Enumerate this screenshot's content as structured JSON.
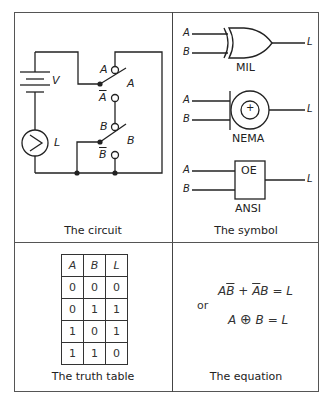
{
  "panels": {
    "circuit": {
      "caption": "The circuit",
      "labels": {
        "voltage": "V",
        "lamp": "L",
        "switch_a_top": "A",
        "switch_a_bar": "A",
        "switch_a_pole": "A",
        "switch_b_top": "B",
        "switch_b_bar": "B",
        "switch_b_pole": "B"
      }
    },
    "symbol": {
      "caption": "The symbol",
      "mil": {
        "label": "MIL",
        "in_a": "A",
        "in_b": "B",
        "out": "L"
      },
      "nema": {
        "label": "NEMA",
        "in_a": "A",
        "in_b": "B",
        "out": "L",
        "glyph": "+"
      },
      "ansi": {
        "label": "ANSI",
        "box_text": "OE",
        "in_a": "A",
        "in_b": "B",
        "out": "L"
      }
    },
    "truth_table": {
      "caption": "The truth table",
      "headers": [
        "A",
        "B",
        "L"
      ],
      "rows": [
        [
          "0",
          "0",
          "0"
        ],
        [
          "0",
          "1",
          "1"
        ],
        [
          "1",
          "0",
          "1"
        ],
        [
          "1",
          "1",
          "0"
        ]
      ]
    },
    "equation": {
      "caption": "The equation",
      "line1": {
        "a": "A",
        "bbar": "B",
        "plus": " + ",
        "abar": "A",
        "b": "B",
        "rhs": " = L"
      },
      "or_label": "or",
      "line2": {
        "a": "A",
        "op": "⊕",
        "b": "B",
        "rhs": " = L"
      }
    }
  },
  "colors": {
    "line": "#222222",
    "frame": "#555555"
  }
}
